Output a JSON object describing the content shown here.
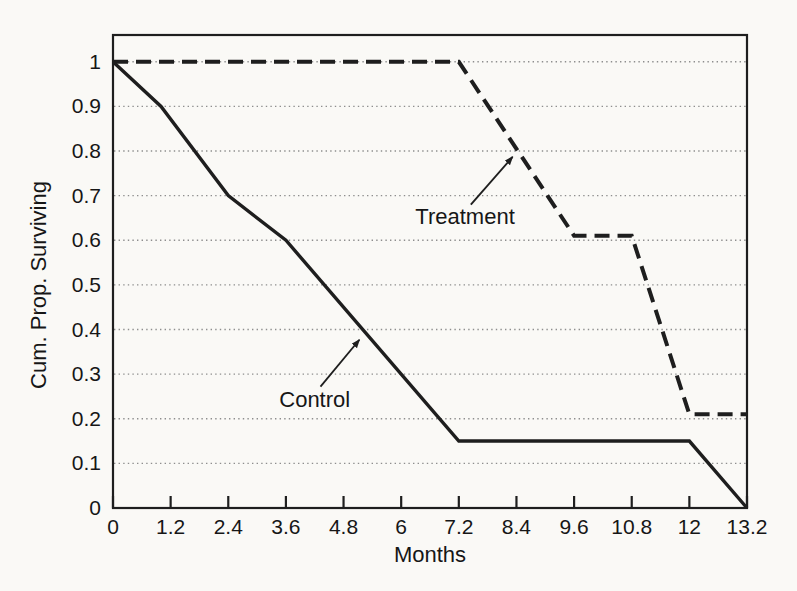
{
  "figure": {
    "background_color": "#faf9f6",
    "line_color": "#1e1e1e",
    "grid_color": "#8e8e8e",
    "text_color": "#161616"
  },
  "chart_data": {
    "type": "line",
    "title": "",
    "xlabel": "Months",
    "ylabel": "Cum. Prop. Surviving",
    "xlim": [
      0,
      13.2
    ],
    "ylim": [
      0,
      1.06
    ],
    "grid": "horizontal dotted gridlines at every 0.1",
    "legend_position": "inline arrow annotations on plot",
    "x_ticks": [
      "0",
      "1.2",
      "2.4",
      "3.6",
      "4.8",
      "6",
      "7.2",
      "8.4",
      "9.6",
      "10.8",
      "12",
      "13.2"
    ],
    "x_tick_values": [
      0,
      1.2,
      2.4,
      3.6,
      4.8,
      6,
      7.2,
      8.4,
      9.6,
      10.8,
      12,
      13.2
    ],
    "y_ticks": [
      "0",
      "0.1",
      "0.2",
      "0.3",
      "0.4",
      "0.5",
      "0.6",
      "0.7",
      "0.8",
      "0.9",
      "1"
    ],
    "y_tick_values": [
      0,
      0.1,
      0.2,
      0.3,
      0.4,
      0.5,
      0.6,
      0.7,
      0.8,
      0.9,
      1
    ],
    "series": [
      {
        "name": "Treatment",
        "line_style": "dashed",
        "points": [
          [
            0,
            1.0
          ],
          [
            7.2,
            1.0
          ],
          [
            9.6,
            0.61
          ],
          [
            10.8,
            0.61
          ],
          [
            12,
            0.21
          ],
          [
            13.2,
            0.21
          ]
        ]
      },
      {
        "name": "Control",
        "line_style": "solid",
        "points": [
          [
            0,
            1.0
          ],
          [
            1,
            0.9
          ],
          [
            2.4,
            0.7
          ],
          [
            3.6,
            0.6
          ],
          [
            7.2,
            0.15
          ],
          [
            12,
            0.15
          ],
          [
            13.2,
            0
          ]
        ]
      }
    ],
    "annotations": [
      {
        "text": "Treatment",
        "label_x": 7.33,
        "label_y": 0.655,
        "arrow_from": [
          7.45,
          0.68
        ],
        "arrow_to": [
          8.32,
          0.787
        ]
      },
      {
        "text": "Control",
        "label_x": 4.2,
        "label_y": 0.245,
        "arrow_from": [
          4.32,
          0.272
        ],
        "arrow_to": [
          5.13,
          0.377
        ]
      }
    ]
  }
}
